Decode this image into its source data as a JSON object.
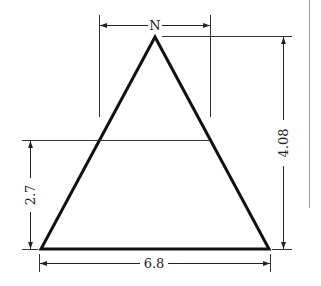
{
  "diagram": {
    "title_label": "N",
    "dimensions": {
      "height_total": "4.08",
      "height_cut": "2.7",
      "base_width": "6.8"
    },
    "colors": {
      "stroke": "#111111",
      "dim_line": "#222222",
      "side_rule": "#999999"
    }
  }
}
